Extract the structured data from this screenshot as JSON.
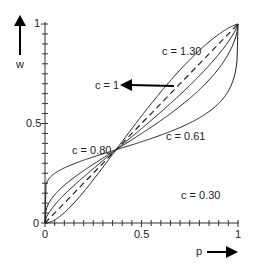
{
  "chart_data": {
    "type": "line",
    "title": "",
    "xlabel": "p",
    "ylabel": "w",
    "xlim": [
      0,
      1
    ],
    "ylim": [
      0,
      1
    ],
    "x_ticks": [
      "0",
      "0.5",
      "1"
    ],
    "y_ticks": [
      "0",
      "0.5",
      "1"
    ],
    "grid": false,
    "legend_position": "inline labels",
    "series": [
      {
        "name": "c = 1",
        "style": "dashed",
        "c": 1.0
      },
      {
        "name": "c = 1.30",
        "style": "solid",
        "c": 1.3
      },
      {
        "name": "c = 0.80",
        "style": "solid",
        "c": 0.8
      },
      {
        "name": "c = 0.61",
        "style": "solid",
        "c": 0.61
      },
      {
        "name": "c = 0.30",
        "style": "solid",
        "c": 0.3
      }
    ],
    "annotations": [
      {
        "text": "c = 1.30",
        "x": 0.62,
        "y": 0.9
      },
      {
        "text": "c = 1",
        "x": 0.25,
        "y": 0.78,
        "arrow": "points left from diagonal"
      },
      {
        "text": "c = 0.80",
        "x": 0.2,
        "y": 0.42
      },
      {
        "text": "c = 0.61",
        "x": 0.6,
        "y": 0.45
      },
      {
        "text": "c = 0.30",
        "x": 0.65,
        "y": 0.12
      }
    ]
  },
  "labels": {
    "y_axis": "w",
    "x_axis": "p",
    "y0": "0",
    "y05": "0.5",
    "y1": "1",
    "x0": "0",
    "x05": "0.5",
    "x1": "1",
    "c130": "c = 1.30",
    "c1": "c = 1",
    "c080": "c = 0.80",
    "c061": "c = 0.61",
    "c030": "c = 0.30"
  }
}
